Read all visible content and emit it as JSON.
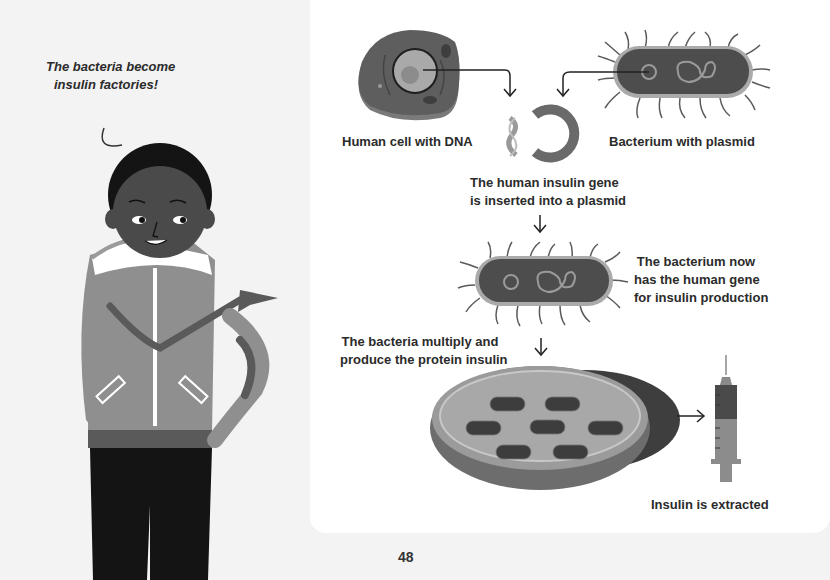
{
  "page": {
    "number": "48",
    "background": "#f3f3f3",
    "panel_color": "#ffffff"
  },
  "speech_bubble": {
    "line1": "The bacteria become",
    "line2": "insulin factories!"
  },
  "diagram": {
    "human_cell_label": "Human cell with DNA",
    "bacterium_label": "Bacterium with plasmid",
    "step1": {
      "line1": "The human insulin gene",
      "line2": "is inserted into a plasmid"
    },
    "step2": {
      "line1": "The bacterium now",
      "line2": "has the human gene",
      "line3": "for insulin production"
    },
    "step3": {
      "line1": "The bacteria multiply and",
      "line2": "produce the protein insulin"
    },
    "result_label": "Insulin is extracted"
  },
  "icons": {
    "human_cell": "human-cell-illustration",
    "bacterium": "bacterium-illustration",
    "plasmid": "plasmid-ring",
    "dna": "dna-fragment",
    "petri_dish": "petri-dish-illustration",
    "syringe": "syringe-illustration",
    "arrow": "down-arrow"
  }
}
